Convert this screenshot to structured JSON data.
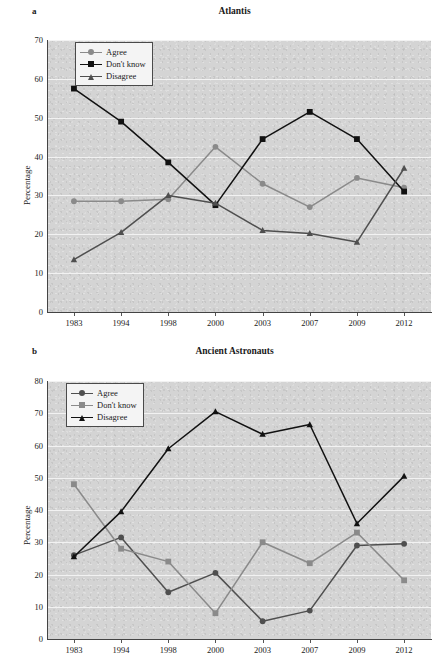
{
  "figure": {
    "panels": [
      {
        "letter": "a",
        "title": "Atlantis",
        "ylabel": "Percentage"
      },
      {
        "letter": "b",
        "title": "Ancient Astronauts",
        "ylabel": "Percentage"
      }
    ]
  },
  "chart_data": [
    {
      "type": "line",
      "title": "Atlantis",
      "panel_letter": "a",
      "xlabel": "",
      "ylabel": "Percentage",
      "x": [
        "1983",
        "1994",
        "1998",
        "2000",
        "2003",
        "2007",
        "2009",
        "2012"
      ],
      "categories": [
        "1983",
        "1994",
        "1998",
        "2000",
        "2003",
        "2007",
        "2009",
        "2012"
      ],
      "ylim": [
        0,
        70
      ],
      "yticks": [
        0,
        10,
        20,
        30,
        40,
        50,
        60,
        70
      ],
      "grid": true,
      "legend_position": "top-left",
      "series": [
        {
          "name": "Agree",
          "color": "#8a8a8a",
          "marker": "circle",
          "values": [
            28.5,
            28.5,
            29.0,
            42.5,
            33.0,
            27.0,
            34.5,
            32.0
          ]
        },
        {
          "name": "Don't know",
          "color": "#111111",
          "marker": "square",
          "values": [
            57.5,
            49.0,
            38.5,
            27.5,
            44.5,
            51.5,
            44.5,
            31.0
          ]
        },
        {
          "name": "Disagree",
          "color": "#4f4f4f",
          "marker": "triangle",
          "values": [
            13.5,
            20.5,
            30.0,
            28.0,
            21.0,
            20.2,
            18.0,
            37.0
          ]
        }
      ]
    },
    {
      "type": "line",
      "title": "Ancient Astronauts",
      "panel_letter": "b",
      "xlabel": "",
      "ylabel": "Percentage",
      "x": [
        "1983",
        "1994",
        "1998",
        "2000",
        "2003",
        "2007",
        "2009",
        "2012"
      ],
      "categories": [
        "1983",
        "1994",
        "1998",
        "2000",
        "2003",
        "2007",
        "2009",
        "2012"
      ],
      "ylim": [
        0,
        80
      ],
      "yticks": [
        0,
        10,
        20,
        30,
        40,
        50,
        60,
        70,
        80
      ],
      "grid": true,
      "legend_position": "top-left",
      "series": [
        {
          "name": "Agree",
          "color": "#4f4f4f",
          "marker": "circle",
          "values": [
            26.0,
            31.5,
            14.5,
            20.5,
            5.5,
            8.8,
            29.0,
            29.5
          ]
        },
        {
          "name": "Don't know",
          "color": "#8a8a8a",
          "marker": "square",
          "values": [
            48.0,
            28.0,
            24.0,
            8.0,
            30.0,
            23.5,
            33.0,
            18.2
          ]
        },
        {
          "name": "Disagree",
          "color": "#111111",
          "marker": "triangle",
          "values": [
            25.5,
            39.5,
            59.0,
            70.5,
            63.5,
            66.5,
            35.8,
            50.5
          ]
        }
      ]
    }
  ],
  "colors": {
    "plot_background": "#d4d4d4",
    "gridline": "#f2f2f2",
    "axis": "#444444",
    "legend_background": "#f4f4f4",
    "legend_border": "#4a4a4a"
  }
}
